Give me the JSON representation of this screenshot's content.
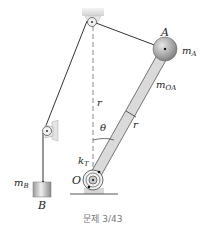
{
  "figure": {
    "caption": "문제 3/43",
    "labels": {
      "A": "A",
      "mA_m": "m",
      "mA_sub": "A",
      "mOA_m": "m",
      "mOA_sub": "OA",
      "r_vertical": "r",
      "r_rod": "r",
      "theta": "θ",
      "kT_k": "k",
      "kT_sub": "T",
      "O": "O",
      "mB_m": "m",
      "mB_sub": "B",
      "B": "B"
    },
    "colors": {
      "line": "#333333",
      "rod_fill": "#d8d8d8",
      "ball": "#9a9a9a",
      "block": "#c8c8c8",
      "support": "#e2e2e2",
      "caption": "#777777"
    }
  }
}
